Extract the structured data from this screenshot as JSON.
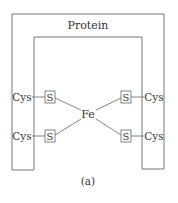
{
  "diagram": {
    "title": "Protein",
    "center_atom": "Fe",
    "caption": "(a)",
    "ligands": [
      {
        "residue": "Cys",
        "atom": "S",
        "side": "left",
        "position": "upper"
      },
      {
        "residue": "Cys",
        "atom": "S",
        "side": "left",
        "position": "lower"
      },
      {
        "residue": "Cys",
        "atom": "S",
        "side": "right",
        "position": "upper"
      },
      {
        "residue": "Cys",
        "atom": "S",
        "side": "right",
        "position": "lower"
      }
    ],
    "colors": {
      "line": "#777777",
      "text": "#333333",
      "background": "#ffffff"
    }
  }
}
